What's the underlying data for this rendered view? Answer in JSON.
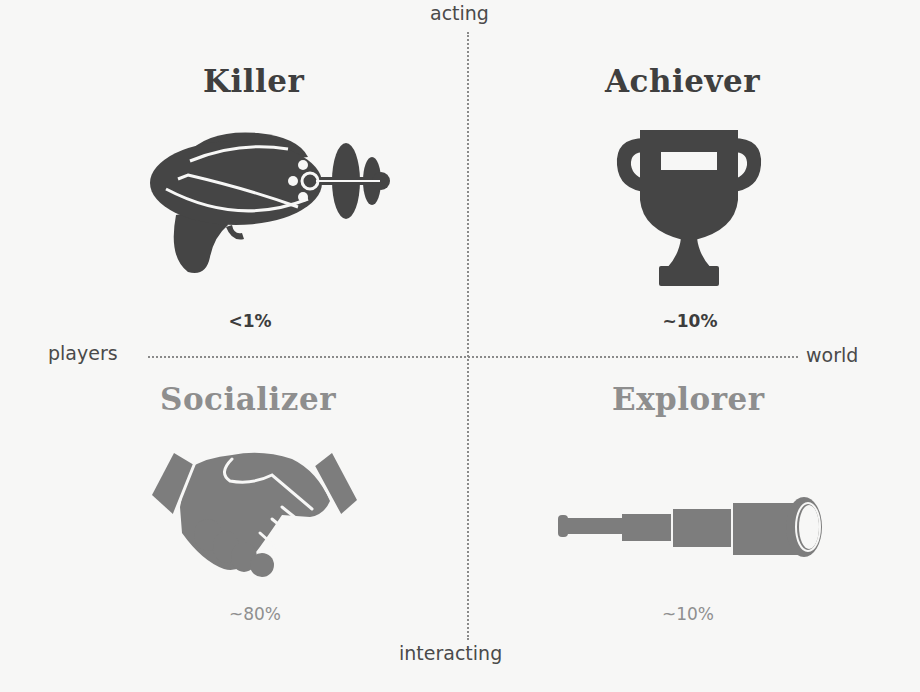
{
  "axes": {
    "top": "acting",
    "bottom": "interacting",
    "left": "players",
    "right": "world"
  },
  "quadrants": [
    {
      "position": "top-left",
      "title": "Killer",
      "icon": "ray-gun-icon",
      "percent": "<1%",
      "color": "#3f3f3f"
    },
    {
      "position": "top-right",
      "title": "Achiever",
      "icon": "trophy-icon",
      "percent": "~10%",
      "color": "#3f3f3f"
    },
    {
      "position": "bottom-left",
      "title": "Socializer",
      "icon": "handshake-icon",
      "percent": "~80%",
      "color": "#8e8e8e"
    },
    {
      "position": "bottom-right",
      "title": "Explorer",
      "icon": "spyglass-icon",
      "percent": "~10%",
      "color": "#8e8e8e"
    }
  ],
  "colors": {
    "background": "#f7f7f6",
    "dark_icon": "#454545",
    "light_icon": "#7d7d7d",
    "axis_line": "#8a8a8a"
  }
}
